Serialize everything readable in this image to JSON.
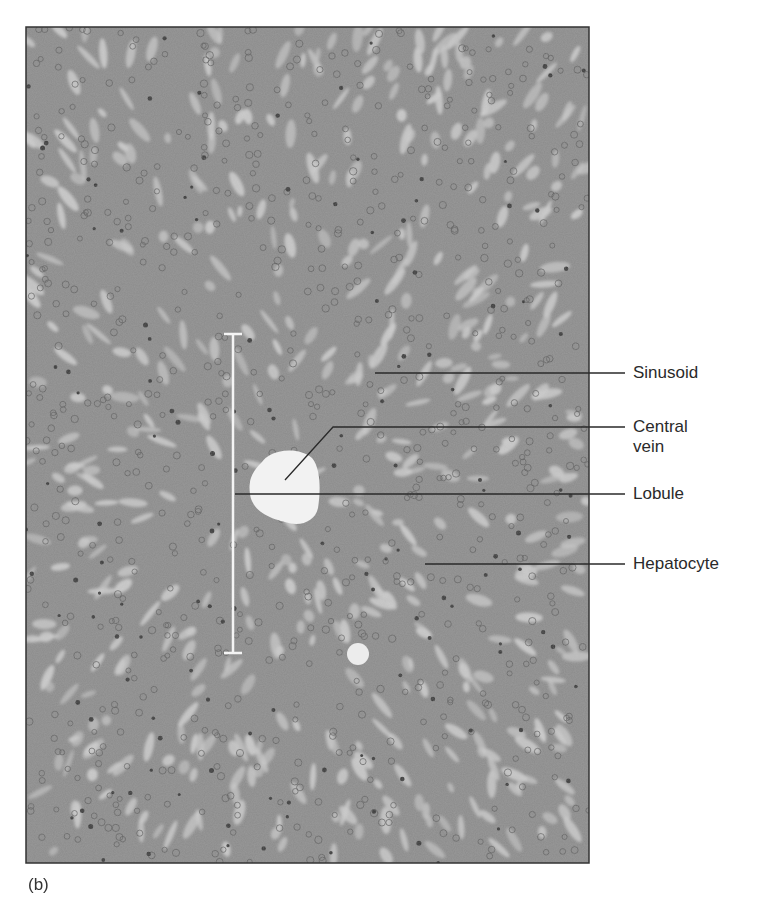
{
  "figure": {
    "panel_label": "(b)",
    "micrograph": {
      "x": 26,
      "y": 27,
      "width": 563,
      "height": 836,
      "tissue_color": "#8c8c8c",
      "sinusoid_color": "#cdcdcd",
      "nucleus_color": "#3a3a3a",
      "border_color": "#333333"
    },
    "central_vein": {
      "cx": 285,
      "cy": 485,
      "color": "#f2f2f2"
    },
    "small_vessel": {
      "cx": 358,
      "cy": 654,
      "r": 11
    },
    "lobule_bracket": {
      "x": 233,
      "y1": 334,
      "y2": 653,
      "cap": 9,
      "color": "#f4f4f4"
    },
    "labels": [
      {
        "id": "sinusoid",
        "text": "Sinusoid",
        "line": [
          [
            375,
            373
          ],
          [
            625,
            373
          ]
        ],
        "text_x": 633,
        "text_y": 363
      },
      {
        "id": "central-vein",
        "text": "Central\nvein",
        "line": [
          [
            285,
            480
          ],
          [
            333,
            427
          ],
          [
            625,
            427
          ]
        ],
        "text_x": 633,
        "text_y": 417
      },
      {
        "id": "lobule",
        "text": "Lobule",
        "line": [
          [
            235,
            494
          ],
          [
            625,
            494
          ]
        ],
        "text_x": 633,
        "text_y": 484
      },
      {
        "id": "hepatocyte",
        "text": "Hepatocyte",
        "line": [
          [
            425,
            564
          ],
          [
            625,
            564
          ]
        ],
        "text_x": 633,
        "text_y": 554
      }
    ],
    "line_color": "#2a2a2a"
  }
}
